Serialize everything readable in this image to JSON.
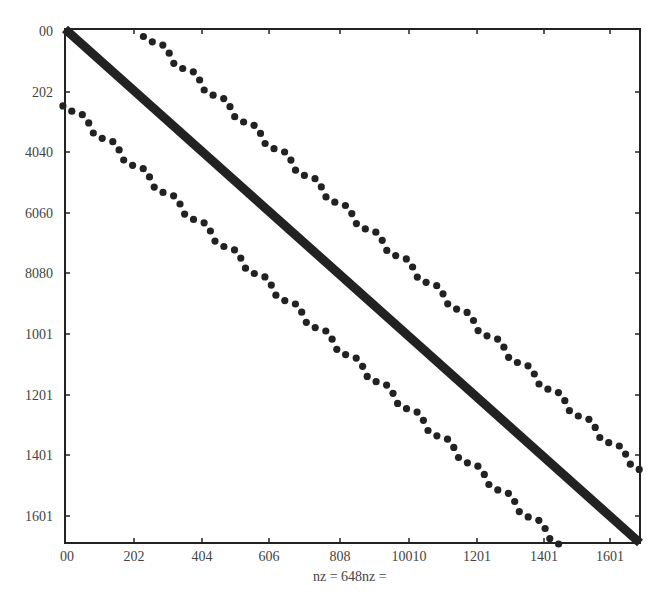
{
  "chart_data": {
    "type": "scatter",
    "subtype": "sparsity-pattern (spy plot)",
    "title": "",
    "xlabel": "nz = 648nz =",
    "ylabel": "",
    "x_ticks": [
      "00",
      "202",
      "404",
      "606",
      "808",
      "10010",
      "1201",
      "1401",
      "1601"
    ],
    "y_ticks": [
      "00",
      "202",
      "4040",
      "6060",
      "8080",
      "1001",
      "1201",
      "1401",
      "1601"
    ],
    "grid": false,
    "legend": null,
    "series": [
      {
        "name": "main diagonal",
        "style": "solid thick band",
        "start": [
          0,
          0
        ],
        "end": [
          1,
          1
        ]
      },
      {
        "name": "upper off-diagonal band",
        "style": "dots",
        "start": [
          0.14,
          0.01
        ],
        "end": [
          1.0,
          0.855
        ],
        "count": 66
      },
      {
        "name": "lower off-diagonal band",
        "style": "dots",
        "start": [
          0.0,
          0.145
        ],
        "end": [
          0.86,
          1.0
        ],
        "count": 66
      }
    ],
    "colors": {
      "markers": "#222222",
      "axes": "#222222",
      "text": "#444444"
    }
  },
  "layout": {
    "plot_left": 65,
    "plot_top": 29,
    "plot_right": 640,
    "plot_bottom": 543,
    "x_tick_px": [
      67,
      134,
      202,
      269,
      340,
      409,
      477,
      544,
      610
    ],
    "y_tick_px": [
      31,
      92,
      152,
      213,
      273,
      334,
      395,
      455,
      516
    ],
    "diagonal_width": 9,
    "dot_radius": 3.6,
    "zigzag_offset": 3.2
  }
}
